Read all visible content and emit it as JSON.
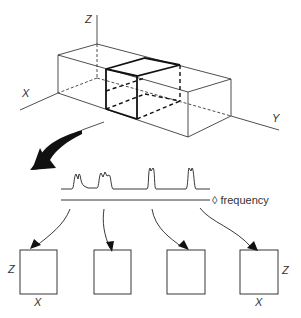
{
  "diagram": {
    "title": "",
    "volume": {
      "axes": {
        "z": "Z",
        "x": "X",
        "y": "Y"
      }
    },
    "spectrum": {
      "axis_label": "frequency",
      "axis_marker": "◊"
    },
    "slices": [
      {
        "z_label": "Z",
        "x_label": "X"
      },
      {
        "z_label": "",
        "x_label": ""
      },
      {
        "z_label": "",
        "x_label": ""
      },
      {
        "z_label": "Z",
        "x_label": "X"
      }
    ],
    "colors": {
      "line": "#222222",
      "background": "#ffffff"
    }
  }
}
